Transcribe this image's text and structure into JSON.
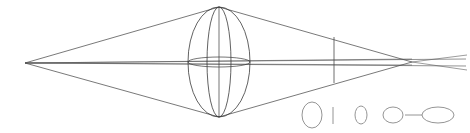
{
  "figure": {
    "background_color": "#ffffff",
    "stroke_color": "#3a3a3a",
    "stroke_color_light": "#6b6b6b",
    "stroke_color_faint": "#8a8a8a",
    "canvas": {
      "width": 470,
      "height": 133
    }
  },
  "geometry": {
    "left_vertex": {
      "x": 25,
      "y": 63,
      "label": "left-apex"
    },
    "right_vertex": {
      "x": 412,
      "y": 62,
      "label": "right-crossing"
    },
    "axis_y": 63,
    "sphere": {
      "center_x": 219,
      "center_y": 62,
      "rx": 31,
      "ry": 55,
      "meridian_rx": 12,
      "equator_ry": 5,
      "label": "sphere-element"
    },
    "aperture_stop": {
      "x": 334,
      "y_top": 37,
      "y_bottom": 83,
      "label": "aperture-stop"
    },
    "cone_upper_apex": {
      "x": 219,
      "y": 7
    },
    "cone_lower_apex": {
      "x": 219,
      "y": 117
    }
  },
  "rays": {
    "upper_left": {
      "x1": 25,
      "y1": 63,
      "x2": 219,
      "y2": 7
    },
    "lower_left": {
      "x1": 25,
      "y1": 63,
      "x2": 219,
      "y2": 117
    },
    "upper_right": {
      "x1": 219,
      "y1": 7,
      "x2": 412,
      "y2": 62
    },
    "lower_right": {
      "x1": 219,
      "y1": 117,
      "x2": 412,
      "y2": 62
    },
    "axis_main": {
      "x1": 25,
      "y1": 63,
      "x2": 466,
      "y2": 66
    },
    "axis_secondary": {
      "x1": 25,
      "y1": 63,
      "x2": 466,
      "y2": 59
    },
    "marginal_upper": {
      "x1": 25,
      "y1": 63,
      "x2": 412,
      "y2": 62
    },
    "marginal_lower": {
      "x1": 25,
      "y1": 63,
      "x2": 412,
      "y2": 62
    },
    "overshoot_upper": {
      "x1": 412,
      "y1": 62,
      "x2": 467,
      "y2": 70
    },
    "overshoot_lower": {
      "x1": 412,
      "y1": 62,
      "x2": 467,
      "y2": 55
    }
  },
  "legend": {
    "name": "scale-legend",
    "items": [
      {
        "name": "legend-ellipse-large",
        "shape": "ellipse",
        "cx": 312,
        "cy": 115,
        "rx": 10,
        "ry": 13
      },
      {
        "name": "legend-tick-bar",
        "shape": "vertical-bar",
        "x": 333,
        "y_top": 107,
        "y_bottom": 124
      },
      {
        "name": "legend-ellipse-small",
        "shape": "ellipse",
        "cx": 361,
        "cy": 115,
        "rx": 6,
        "ry": 9
      },
      {
        "name": "legend-circle",
        "shape": "ellipse",
        "cx": 393,
        "cy": 115,
        "rx": 10,
        "ry": 8
      },
      {
        "name": "legend-connector-dash",
        "shape": "dash",
        "x1": 405,
        "y1": 115,
        "x2": 422,
        "y2": 115
      },
      {
        "name": "legend-ellipse-flat",
        "shape": "ellipse",
        "cx": 438,
        "cy": 115,
        "rx": 16,
        "ry": 8
      }
    ]
  }
}
